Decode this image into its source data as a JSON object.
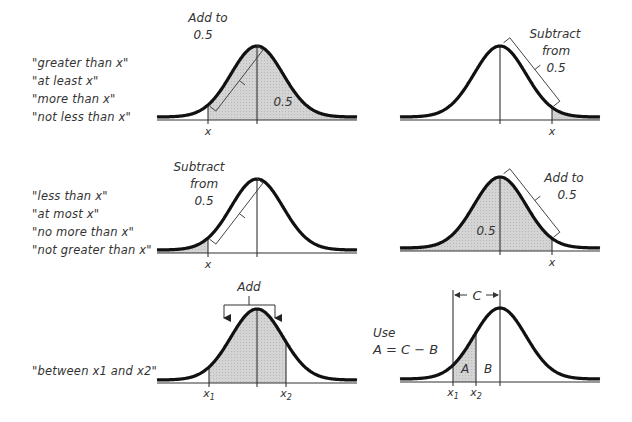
{
  "rows": [
    {
      "labels": [
        "\"greater than x\"",
        "\"at least x\"",
        "\"more than x\"",
        "\"not less than x\""
      ],
      "left_panel": {
        "annotation": [
          "Add to",
          "0.5"
        ],
        "area_label": "0.5",
        "x_label": "x"
      },
      "right_panel": {
        "annotation": [
          "Subtract",
          "from",
          "0.5"
        ],
        "x_label": "x"
      }
    },
    {
      "labels": [
        "\"less than x\"",
        "\"at most x\"",
        "\"no more than x\"",
        "\"not greater than x\""
      ],
      "left_panel": {
        "annotation": [
          "Subtract",
          "from",
          "0.5"
        ],
        "x_label": "x"
      },
      "right_panel": {
        "annotation": [
          "Add to",
          "0.5"
        ],
        "area_label": "0.5",
        "x_label": "x"
      }
    },
    {
      "labels": [
        "\"between x1 and x2\""
      ],
      "left_panel": {
        "annotation": [
          "Add"
        ],
        "x1_label": "x1",
        "x2_label": "x2"
      },
      "right_panel": {
        "annotation": [
          "Use",
          "A = C − B"
        ],
        "span_label": "C",
        "region_a": "A",
        "region_b": "B",
        "x1_label": "x1",
        "x2_label": "x2"
      }
    }
  ],
  "colors": {
    "curve": "#111111",
    "shade": "#cfcfcf",
    "axis": "#333333",
    "text": "#333333"
  }
}
